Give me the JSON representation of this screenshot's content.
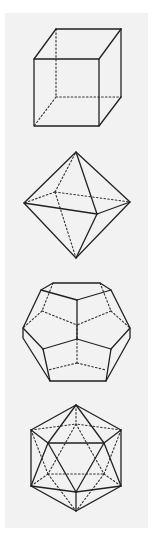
{
  "figure": {
    "background": "#ffffff",
    "panel_color": "#f2f2f2",
    "line_color": "#222222",
    "solids": [
      {
        "name": "cube",
        "label": "Cube"
      },
      {
        "name": "octahedron",
        "label": "Octahedron"
      },
      {
        "name": "dodecahedron",
        "label": "Dodecahedron"
      },
      {
        "name": "icosahedron",
        "label": "Icosahedron"
      }
    ]
  }
}
